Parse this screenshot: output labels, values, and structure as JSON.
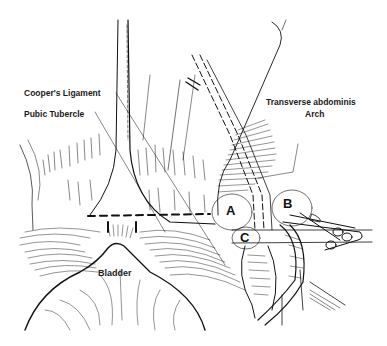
{
  "figure": {
    "type": "anatomical line illustration",
    "labels": {
      "coopers_ligament": "Cooper's Ligament",
      "pubic_tubercle": "Pubic Tubercle",
      "transverse_abdominis_line1": "Transverse abdominis",
      "transverse_abdominis_line2": "Arch",
      "bladder": "Bladder"
    },
    "regions": {
      "a": "A",
      "b": "B",
      "c": "C"
    },
    "colors": {
      "ink": "#111111",
      "background": "#ffffff"
    }
  }
}
